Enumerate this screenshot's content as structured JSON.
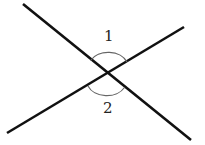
{
  "diagram": {
    "angles": [
      {
        "label": "1",
        "position": "top"
      },
      {
        "label": "2",
        "position": "bottom"
      }
    ],
    "colors": {
      "line": "#111111",
      "arc": "#666666",
      "background": "#ffffff"
    }
  }
}
